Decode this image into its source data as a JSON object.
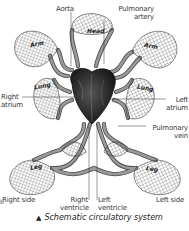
{
  "figure": {
    "caption_marker": "▲",
    "caption": "Schematic circulatory system",
    "figure_letter": "b"
  },
  "labels": {
    "aorta": "Aorta",
    "pulmonary_artery_1": "Pulmonary",
    "pulmonary_artery_2": "artery",
    "right_atrium_1": "Right",
    "right_atrium_2": "atrium",
    "left_atrium_1": "Left",
    "left_atrium_2": "atrium",
    "pulmonary_vein_1": "Pulmonary",
    "pulmonary_vein_2": "vein",
    "right_side": "Right side",
    "left_side": "Left side",
    "right_ventricle_1": "Right",
    "right_ventricle_2": "ventricle",
    "left_ventricle_1": "Left",
    "left_ventricle_2": "ventricle"
  },
  "organs": {
    "arm_left": "Arm",
    "arm_right": "Arm",
    "head": "Head",
    "lung_left": "Lung",
    "lung_right": "Lung",
    "leg_left": "Leg",
    "leg_right": "Leg"
  },
  "colors": {
    "vessel": "#8a8a8a",
    "vessel_edge": "#4a4a4a",
    "mesh": "#3a3a3a",
    "heart": "#2a2a2a",
    "leader": "#333333"
  }
}
